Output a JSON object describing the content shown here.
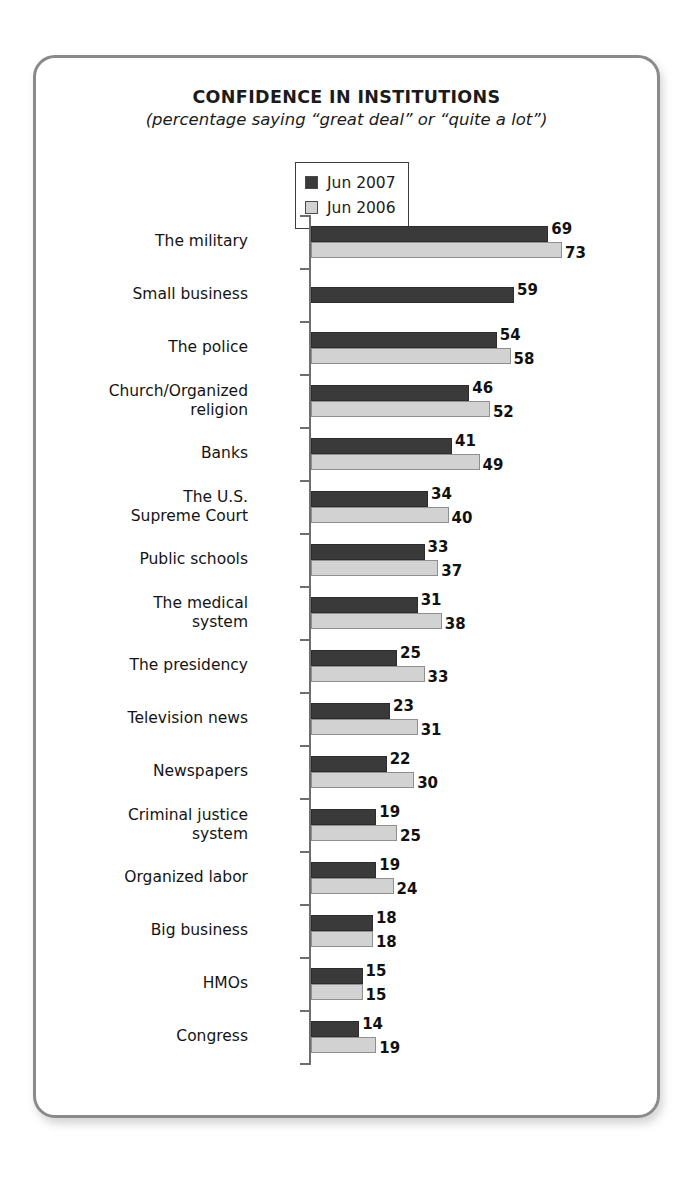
{
  "card": {
    "title": "CONFIDENCE IN INSTITUTIONS",
    "subtitle": "(percentage saying “great deal” or “quite a lot”)"
  },
  "legend": {
    "entries": [
      {
        "label": "Jun 2007",
        "color": "#3a3a3a"
      },
      {
        "label": "Jun 2006",
        "color": "#d2d2d2"
      }
    ]
  },
  "chart_data": {
    "type": "bar",
    "orientation": "horizontal",
    "title": "CONFIDENCE IN INSTITUTIONS",
    "subtitle": "(percentage saying “great deal” or “quite a lot”)",
    "xlabel": "",
    "ylabel": "",
    "xlim": [
      0,
      73
    ],
    "grid": false,
    "legend_position": "top-center",
    "units": "percent",
    "categories": [
      "The military",
      "Small business",
      "The police",
      "Church/Organized religion",
      "Banks",
      "The U.S. Supreme Court",
      "Public schools",
      "The medical system",
      "The presidency",
      "Television news",
      "Newspapers",
      "Criminal justice system",
      "Organized labor",
      "Big business",
      "HMOs",
      "Congress"
    ],
    "category_lines": [
      [
        "The military"
      ],
      [
        "Small business"
      ],
      [
        "The police"
      ],
      [
        "Church/Organized",
        "religion"
      ],
      [
        "Banks"
      ],
      [
        "The U.S.",
        "Supreme Court"
      ],
      [
        "Public schools"
      ],
      [
        "The medical",
        "system"
      ],
      [
        "The presidency"
      ],
      [
        "Television news"
      ],
      [
        "Newspapers"
      ],
      [
        "Criminal justice",
        "system"
      ],
      [
        "Organized labor"
      ],
      [
        "Big business"
      ],
      [
        "HMOs"
      ],
      [
        "Congress"
      ]
    ],
    "series": [
      {
        "name": "Jun 2007",
        "color": "#3a3a3a",
        "values": [
          69,
          59,
          54,
          46,
          41,
          34,
          33,
          31,
          25,
          23,
          22,
          19,
          19,
          18,
          15,
          14
        ]
      },
      {
        "name": "Jun 2006",
        "color": "#d2d2d2",
        "values": [
          73,
          null,
          58,
          52,
          49,
          40,
          37,
          38,
          33,
          31,
          30,
          25,
          24,
          18,
          15,
          19
        ]
      }
    ]
  }
}
